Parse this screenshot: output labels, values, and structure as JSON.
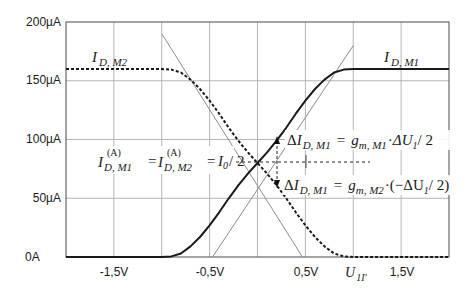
{
  "chart_data": {
    "type": "line",
    "title": "",
    "xlabel": "U_1I'",
    "ylabel": "",
    "xlim": [
      -2.0,
      2.0
    ],
    "ylim": [
      0,
      200
    ],
    "grid": true,
    "x_ticks": [
      -2.0,
      -1.5,
      -1.0,
      -0.5,
      0.0,
      0.5,
      1.0,
      1.5,
      2.0
    ],
    "x_tick_labels": [
      {
        "x": -1.5,
        "label": "-1,5V"
      },
      {
        "x": -0.5,
        "label": "-0,5V"
      },
      {
        "x": 0.5,
        "label": "0,5V"
      },
      {
        "x": 1.0,
        "label": "U_1I'"
      },
      {
        "x": 1.5,
        "label": "1,5V"
      }
    ],
    "y_ticks": [
      0,
      50,
      100,
      150,
      200
    ],
    "y_tick_labels": [
      "0A",
      "50µA",
      "100µA",
      "150µA",
      "200µA"
    ],
    "y_unit": "µA",
    "series": [
      {
        "name": "I_D,M1",
        "style": "solid",
        "color": "#1a1a1a",
        "x": [
          -2.0,
          -1.0,
          -0.9,
          -0.8,
          -0.7,
          -0.6,
          -0.5,
          -0.4,
          -0.3,
          -0.2,
          -0.1,
          0.0,
          0.1,
          0.2,
          0.3,
          0.4,
          0.5,
          0.6,
          0.7,
          0.8,
          0.9,
          1.0,
          2.0
        ],
        "y": [
          0,
          0,
          0.5,
          3,
          9,
          17,
          27,
          38,
          50,
          61,
          71,
          80,
          89,
          99,
          110,
          122,
          133,
          143,
          151,
          157,
          159.5,
          160,
          160
        ]
      },
      {
        "name": "I_D,M2",
        "style": "dashed",
        "color": "#1a1a1a",
        "x": [
          -2.0,
          -1.0,
          -0.9,
          -0.8,
          -0.7,
          -0.6,
          -0.5,
          -0.4,
          -0.3,
          -0.2,
          -0.1,
          0.0,
          0.1,
          0.2,
          0.3,
          0.4,
          0.5,
          0.6,
          0.7,
          0.8,
          0.9,
          1.0,
          2.0
        ],
        "y": [
          160,
          160,
          159.5,
          157,
          151,
          143,
          133,
          122,
          110,
          99,
          89,
          80,
          71,
          61,
          50,
          38,
          27,
          17,
          9,
          3,
          0.5,
          0,
          0
        ]
      },
      {
        "name": "tangent M1",
        "style": "solid-thin",
        "color": "#8c8c8c",
        "x": [
          -0.47,
          1.0
        ],
        "y": [
          0,
          180
        ]
      },
      {
        "name": "tangent M2",
        "style": "solid-thin",
        "color": "#8c8c8c",
        "x": [
          -1.0,
          0.47
        ],
        "y": [
          190,
          0
        ]
      }
    ],
    "annotations": [
      {
        "text": "I_D,M2",
        "x": -1.4,
        "y": 168
      },
      {
        "text": "I_D,M1",
        "x": 1.4,
        "y": 168
      },
      {
        "text": "I_D,M1^(A) = I_D,M2^(A) = I_0/2",
        "x": -0.25,
        "y": 80
      },
      {
        "text": "ΔI_D,M1 = g_m,M1 · ΔU_1/2",
        "x": 0.25,
        "y": 100
      },
      {
        "text": "ΔI_D,M1 = g_m,M2 · (−ΔU_1/2)",
        "x": 0.25,
        "y": 58
      }
    ],
    "operating_point": {
      "x": 0.0,
      "y": 80
    },
    "delta_marker": {
      "x": 0.25,
      "y_top": 102,
      "y_bottom": 58
    }
  },
  "labels": {
    "y_ticks": [
      "200µA",
      "150µA",
      "100µA",
      "50µA",
      "0A"
    ],
    "x_ticks": [
      "-1,5V",
      "-0,5V",
      "0,5V",
      "1,5V"
    ],
    "x_axis_var_main": "U",
    "x_axis_var_sub": "1I'",
    "curve_m2": {
      "main": "I",
      "sub": "D, M2"
    },
    "curve_m1": {
      "main": "I",
      "sub": "D, M1"
    },
    "op_point": {
      "lhs_main": "I",
      "lhs_sup": "(A)",
      "lhs_sub": "D, M1",
      "eq1": "=",
      "mid_main": "I",
      "mid_sup": "(A)",
      "mid_sub": "D, M2",
      "eq2": "=",
      "rhs_main": "I",
      "rhs_sub": "0",
      "rhs_tail": "/ 2"
    },
    "delta_up": {
      "delta": "Δ",
      "main": "I",
      "sub": "D, M1",
      "eq": "=",
      "g": "g",
      "g_sub": "m, M1",
      "dot": "·",
      "du": "ΔU",
      "du_sub": "1",
      "tail": "/ 2"
    },
    "delta_down": {
      "delta": "Δ",
      "main": "I",
      "sub": "D, M1",
      "eq": "=",
      "g": "g",
      "g_sub": "m, M2",
      "dot": "·",
      "open": "(−ΔU",
      "du_sub": "1",
      "tail": "/ 2)"
    }
  }
}
